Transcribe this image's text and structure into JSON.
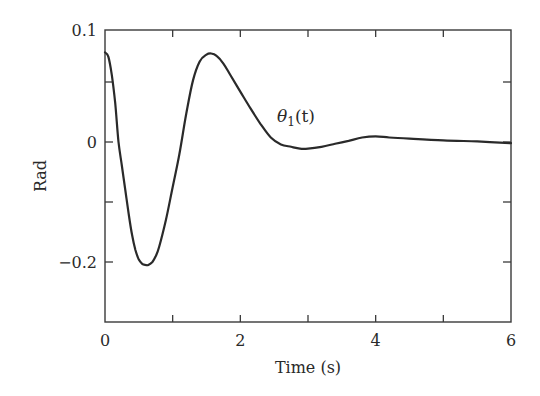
{
  "chart_data": {
    "type": "line",
    "title": "",
    "xlabel": "Time (s)",
    "ylabel": "Rad",
    "xlim": [
      0,
      6
    ],
    "ylim": [
      -0.3,
      0.1
    ],
    "grid": false,
    "legend": null,
    "x_ticks": [
      0,
      1,
      2,
      3,
      4,
      5,
      6
    ],
    "x_tick_labels": [
      "0",
      "",
      "2",
      "",
      "4",
      "",
      "6"
    ],
    "y_ticks": [
      0.1,
      0.05,
      0,
      -0.1,
      -0.2,
      -0.3
    ],
    "y_tick_labels": [
      "0.1",
      "",
      "0",
      "",
      "-0.2",
      ""
    ],
    "annotations": [
      {
        "text": "θ1(t)",
        "x": 2.6,
        "y": 0.018
      }
    ],
    "series": [
      {
        "name": "θ1(t)",
        "color": "#2a2a2a",
        "x": [
          0,
          0.05,
          0.1,
          0.15,
          0.2,
          0.25,
          0.3,
          0.35,
          0.4,
          0.45,
          0.5,
          0.55,
          0.6,
          0.64,
          0.7,
          0.75,
          0.8,
          0.9,
          1.0,
          1.1,
          1.2,
          1.3,
          1.4,
          1.5,
          1.57,
          1.65,
          1.75,
          1.85,
          2.0,
          2.15,
          2.3,
          2.45,
          2.6,
          2.75,
          2.88,
          3.0,
          3.2,
          3.4,
          3.6,
          3.8,
          4.0,
          4.2,
          4.5,
          5.0,
          5.5,
          6.0
        ],
        "y": [
          0.08,
          0.076,
          0.06,
          0.035,
          0.0,
          -0.04,
          -0.08,
          -0.12,
          -0.155,
          -0.18,
          -0.196,
          -0.203,
          -0.205,
          -0.205,
          -0.2,
          -0.19,
          -0.175,
          -0.13,
          -0.075,
          -0.02,
          0.025,
          0.055,
          0.072,
          0.078,
          0.079,
          0.077,
          0.07,
          0.06,
          0.045,
          0.03,
          0.016,
          0.004,
          -0.004,
          -0.008,
          -0.011,
          -0.011,
          -0.008,
          -0.003,
          0.001,
          0.004,
          0.005,
          0.004,
          0.003,
          0.0015,
          0.0005,
          -0.002
        ]
      }
    ]
  }
}
